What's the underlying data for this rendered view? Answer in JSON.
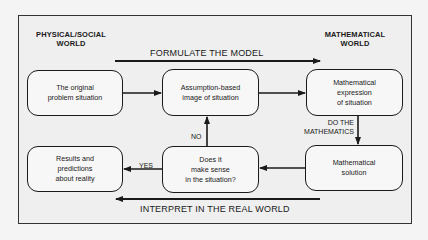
{
  "diagram": {
    "left_world_label": "PHYSICAL/SOCIAL\nWORLD",
    "right_world_label": "MATHEMATICAL\nWORLD",
    "top_flow_label": "FORMULATE THE MODEL",
    "bottom_flow_label": "INTERPRET IN THE REAL WORLD",
    "nodes": {
      "original_problem": "The original\nproblem situation",
      "assumption_image": "Assumption-based\nimage of situation",
      "math_expression": "Mathematical\nexpression\nof situation",
      "math_solution": "Mathematical\nsolution",
      "makes_sense": "Does it\nmake sense\nin the situation?",
      "results": "Results and\npredictions\nabout reality"
    },
    "edge_labels": {
      "do_math": "DO THE\nMATHEMATICS",
      "no": "NO",
      "yes": "YES"
    },
    "edges": [
      {
        "from": "original_problem",
        "to": "assumption_image"
      },
      {
        "from": "assumption_image",
        "to": "math_expression"
      },
      {
        "from": "math_expression",
        "to": "math_solution",
        "label": "DO THE MATHEMATICS"
      },
      {
        "from": "math_solution",
        "to": "makes_sense"
      },
      {
        "from": "makes_sense",
        "to": "assumption_image",
        "label": "NO"
      },
      {
        "from": "makes_sense",
        "to": "results",
        "label": "YES"
      }
    ],
    "colors": {
      "background": "#efefef",
      "stroke": "#1a1a1a"
    }
  }
}
